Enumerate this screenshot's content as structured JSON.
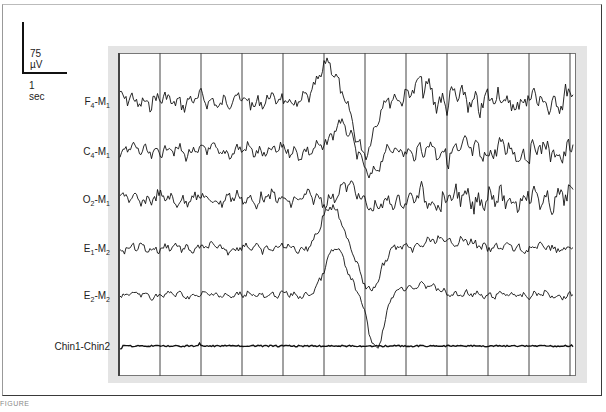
{
  "figure": {
    "scale_bar": {
      "vertical_label": "75 µV",
      "horizontal_label": "1 sec"
    },
    "caption": "FIGURE"
  },
  "chart_data": {
    "type": "line",
    "title": "",
    "xlabel": "time (1 sec per grid division)",
    "ylabel": "amplitude (scale 75 µV)",
    "grid": true,
    "grid_divisions_seconds": 11,
    "channels": [
      {
        "name": "F4-M1",
        "label_main": "F",
        "label_sub1": "4",
        "label_mid": "-M",
        "label_sub2": "1"
      },
      {
        "name": "C4-M1",
        "label_main": "C",
        "label_sub1": "4",
        "label_mid": "-M",
        "label_sub2": "1"
      },
      {
        "name": "O2-M1",
        "label_main": "O",
        "label_sub1": "2",
        "label_mid": "-M",
        "label_sub2": "1"
      },
      {
        "name": "E1-M2",
        "label_main": "E",
        "label_sub1": "1",
        "label_mid": "-M",
        "label_sub2": "2"
      },
      {
        "name": "E2-M2",
        "label_main": "E",
        "label_sub1": "2",
        "label_mid": "-M",
        "label_sub2": "2"
      },
      {
        "name": "Chin1-Chin2",
        "label_main": "Chin1-Chin2",
        "label_sub1": "",
        "label_mid": "",
        "label_sub2": ""
      }
    ],
    "event": {
      "type": "K-complex",
      "approx_time_seconds": [
        5.0,
        6.2
      ]
    }
  }
}
